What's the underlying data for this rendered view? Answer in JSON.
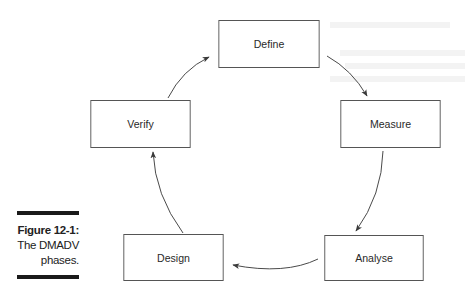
{
  "diagram": {
    "type": "cycle",
    "phases": [
      {
        "id": "define",
        "label": "Define"
      },
      {
        "id": "measure",
        "label": "Measure"
      },
      {
        "id": "analyse",
        "label": "Analyse"
      },
      {
        "id": "design",
        "label": "Design"
      },
      {
        "id": "verify",
        "label": "Verify"
      }
    ],
    "flow": [
      {
        "from": "Define",
        "to": "Measure"
      },
      {
        "from": "Measure",
        "to": "Analyse"
      },
      {
        "from": "Analyse",
        "to": "Design"
      },
      {
        "from": "Design",
        "to": "Verify"
      },
      {
        "from": "Verify",
        "to": "Define"
      }
    ],
    "colors": {
      "box_border": "#555555",
      "text": "#2a2a2a",
      "arrow": "#4a4a4a",
      "caption_bar": "#1a1a1a"
    }
  },
  "caption": {
    "figure_label": "Figure 12-1:",
    "line1": "The DMADV",
    "line2": "phases."
  }
}
